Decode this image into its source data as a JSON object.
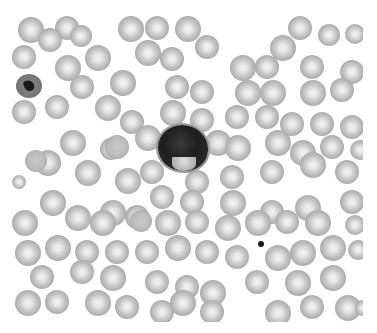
{
  "image": {
    "subject": "blood smear micrograph",
    "width": 377,
    "height": 333,
    "frame": {
      "left": 12,
      "top": 15,
      "right": 363,
      "bottom": 322
    },
    "colors": {
      "background": "#ffffff",
      "rbc_rim": "#a9a9a9",
      "rbc_center": "#f4f4f4",
      "nucleus": "#1e1e1e"
    }
  },
  "cells": {
    "wbc": {
      "type": "large-dark-leukocyte",
      "x": 158,
      "y": 125,
      "w": 50,
      "h": 46
    },
    "lymph": {
      "type": "small-stained-cell",
      "x": 16,
      "y": 74,
      "w": 26,
      "h": 24
    },
    "platelet": {
      "type": "platelet",
      "x": 258,
      "y": 241,
      "w": 6,
      "h": 6
    },
    "rbcs": [
      [
        18,
        17,
        26
      ],
      [
        55,
        16,
        24
      ],
      [
        118,
        16,
        26
      ],
      [
        145,
        16,
        24
      ],
      [
        175,
        16,
        26
      ],
      [
        288,
        16,
        24
      ],
      [
        318,
        24,
        22
      ],
      [
        345,
        24,
        20
      ],
      [
        38,
        28,
        24
      ],
      [
        70,
        25,
        22
      ],
      [
        135,
        40,
        26
      ],
      [
        160,
        47,
        24
      ],
      [
        195,
        35,
        24
      ],
      [
        270,
        35,
        26
      ],
      [
        300,
        55,
        24
      ],
      [
        12,
        45,
        24
      ],
      [
        55,
        55,
        26
      ],
      [
        85,
        45,
        26
      ],
      [
        230,
        55,
        26
      ],
      [
        255,
        55,
        24
      ],
      [
        340,
        60,
        24
      ],
      [
        70,
        75,
        24
      ],
      [
        110,
        70,
        26
      ],
      [
        165,
        75,
        24
      ],
      [
        190,
        80,
        24
      ],
      [
        235,
        80,
        26
      ],
      [
        260,
        80,
        26
      ],
      [
        300,
        80,
        26
      ],
      [
        330,
        78,
        24
      ],
      [
        12,
        100,
        24
      ],
      [
        45,
        95,
        24
      ],
      [
        95,
        95,
        26
      ],
      [
        120,
        110,
        24
      ],
      [
        160,
        100,
        26
      ],
      [
        190,
        108,
        24
      ],
      [
        225,
        105,
        24
      ],
      [
        255,
        105,
        24
      ],
      [
        280,
        112,
        24
      ],
      [
        310,
        112,
        24
      ],
      [
        340,
        115,
        24
      ],
      [
        60,
        130,
        26
      ],
      [
        100,
        138,
        22
      ],
      [
        135,
        125,
        26
      ],
      [
        205,
        130,
        26
      ],
      [
        225,
        135,
        26
      ],
      [
        265,
        130,
        26
      ],
      [
        290,
        140,
        26
      ],
      [
        320,
        135,
        24
      ],
      [
        350,
        140,
        20
      ],
      [
        35,
        150,
        26
      ],
      [
        75,
        160,
        26
      ],
      [
        115,
        168,
        26
      ],
      [
        140,
        160,
        24
      ],
      [
        185,
        170,
        24
      ],
      [
        220,
        165,
        24
      ],
      [
        260,
        160,
        24
      ],
      [
        300,
        152,
        26
      ],
      [
        335,
        160,
        24
      ],
      [
        12,
        175,
        14
      ],
      [
        40,
        190,
        26
      ],
      [
        100,
        200,
        26
      ],
      [
        150,
        185,
        24
      ],
      [
        180,
        190,
        24
      ],
      [
        220,
        190,
        26
      ],
      [
        260,
        200,
        24
      ],
      [
        295,
        195,
        26
      ],
      [
        340,
        190,
        24
      ],
      [
        12,
        210,
        26
      ],
      [
        65,
        205,
        26
      ],
      [
        90,
        210,
        26
      ],
      [
        125,
        205,
        24
      ],
      [
        155,
        210,
        26
      ],
      [
        185,
        210,
        24
      ],
      [
        215,
        215,
        26
      ],
      [
        245,
        210,
        26
      ],
      [
        275,
        210,
        24
      ],
      [
        305,
        210,
        26
      ],
      [
        345,
        215,
        20
      ],
      [
        15,
        240,
        26
      ],
      [
        45,
        235,
        26
      ],
      [
        75,
        240,
        24
      ],
      [
        105,
        240,
        24
      ],
      [
        135,
        240,
        24
      ],
      [
        165,
        235,
        26
      ],
      [
        195,
        240,
        24
      ],
      [
        225,
        245,
        24
      ],
      [
        265,
        245,
        26
      ],
      [
        290,
        240,
        26
      ],
      [
        320,
        235,
        26
      ],
      [
        348,
        240,
        20
      ],
      [
        30,
        265,
        24
      ],
      [
        70,
        260,
        24
      ],
      [
        100,
        265,
        26
      ],
      [
        145,
        270,
        24
      ],
      [
        175,
        275,
        24
      ],
      [
        200,
        280,
        26
      ],
      [
        245,
        270,
        24
      ],
      [
        285,
        270,
        26
      ],
      [
        320,
        265,
        26
      ],
      [
        15,
        290,
        26
      ],
      [
        45,
        290,
        24
      ],
      [
        85,
        290,
        26
      ],
      [
        115,
        295,
        24
      ],
      [
        150,
        300,
        24
      ],
      [
        170,
        290,
        26
      ],
      [
        200,
        300,
        24
      ],
      [
        265,
        300,
        26
      ],
      [
        300,
        295,
        24
      ],
      [
        335,
        295,
        26
      ],
      [
        355,
        300,
        16
      ]
    ],
    "flat_rbcs": [
      [
        105,
        135,
        24
      ],
      [
        130,
        210,
        22
      ],
      [
        25,
        150,
        22
      ]
    ]
  }
}
